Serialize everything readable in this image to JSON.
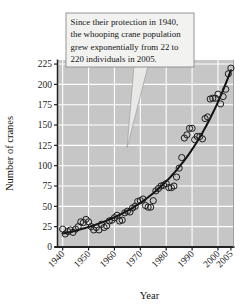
{
  "chart_data": {
    "type": "scatter",
    "title": "",
    "xlabel": "Year",
    "ylabel": "Number of cranes",
    "xlim": [
      1938,
      2006
    ],
    "ylim": [
      0,
      230
    ],
    "grid": true,
    "legend": "none",
    "x_ticks": [
      "1940",
      "1950",
      "1960",
      "1970",
      "1980",
      "1990",
      "2000",
      "2005"
    ],
    "x_tick_values": [
      1940,
      1950,
      1960,
      1970,
      1980,
      1990,
      2000,
      2005
    ],
    "y_ticks": [
      "0",
      "25",
      "50",
      "75",
      "100",
      "125",
      "150",
      "175",
      "200",
      "225"
    ],
    "y_tick_values": [
      0,
      25,
      50,
      75,
      100,
      125,
      150,
      175,
      200,
      225
    ],
    "marker": "open-circle",
    "series": [
      {
        "name": "Whooping crane counts",
        "x": [
          1940,
          1941,
          1942,
          1943,
          1944,
          1945,
          1946,
          1947,
          1948,
          1949,
          1950,
          1951,
          1952,
          1953,
          1954,
          1955,
          1956,
          1957,
          1958,
          1959,
          1960,
          1961,
          1962,
          1963,
          1964,
          1965,
          1966,
          1967,
          1968,
          1969,
          1970,
          1971,
          1972,
          1973,
          1974,
          1975,
          1976,
          1977,
          1978,
          1979,
          1980,
          1981,
          1982,
          1983,
          1984,
          1985,
          1986,
          1987,
          1988,
          1989,
          1990,
          1991,
          1992,
          1993,
          1994,
          1995,
          1996,
          1997,
          1998,
          1999,
          2000,
          2001,
          2002,
          2003,
          2004,
          2005
        ],
        "y": [
          22,
          16,
          19,
          21,
          18,
          22,
          25,
          31,
          30,
          34,
          31,
          25,
          21,
          24,
          21,
          28,
          24,
          26,
          32,
          33,
          36,
          39,
          32,
          33,
          42,
          44,
          43,
          48,
          50,
          56,
          57,
          59,
          51,
          49,
          49,
          57,
          69,
          72,
          75,
          76,
          78,
          73,
          73,
          75,
          86,
          97,
          110,
          134,
          138,
          146,
          146,
          132,
          136,
          136,
          133,
          158,
          160,
          182,
          183,
          183,
          188,
          176,
          185,
          194,
          213,
          220
        ]
      }
    ],
    "trend": {
      "type": "exponential",
      "label": "exponential fit",
      "description": "grew exponentially from 22 to 220 individuals"
    }
  },
  "callout": {
    "lines": [
      "Since their protection in 1940,",
      "the whooping crane population",
      "grew exponentially from 22 to",
      "220 individuals in 2005."
    ]
  },
  "colors": {
    "plot_background": "#c6c6c6",
    "gridline": "#ffffff",
    "curve": "#111111",
    "marker_stroke": "#1c1c1c",
    "callout_background": "#f2f2f0",
    "callout_border": "#8a8a8a",
    "axis": "#222222"
  }
}
